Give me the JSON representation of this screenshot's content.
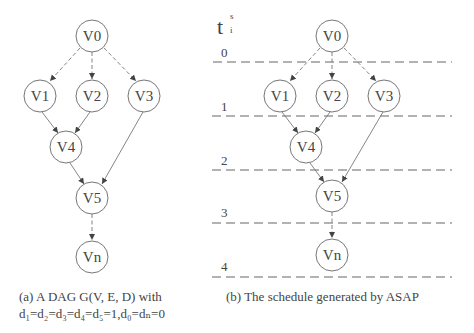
{
  "left_panel": {
    "caption_line1": "(a) A DAG G(V, E, D) with",
    "caption_line2": "d₁=d₂=d₃=d₄=d₅=1,d₀=dₙ=0",
    "nodes": [
      {
        "id": "V0",
        "label": "V0"
      },
      {
        "id": "V1",
        "label": "V1"
      },
      {
        "id": "V2",
        "label": "V2"
      },
      {
        "id": "V3",
        "label": "V3"
      },
      {
        "id": "V4",
        "label": "V4"
      },
      {
        "id": "V5",
        "label": "V5"
      },
      {
        "id": "Vn",
        "label": "Vn"
      }
    ],
    "edges": [
      {
        "from": "V0",
        "to": "V1",
        "style": "dashed"
      },
      {
        "from": "V0",
        "to": "V2",
        "style": "dashed"
      },
      {
        "from": "V0",
        "to": "V3",
        "style": "dashed"
      },
      {
        "from": "V1",
        "to": "V4",
        "style": "solid"
      },
      {
        "from": "V2",
        "to": "V4",
        "style": "solid"
      },
      {
        "from": "V4",
        "to": "V5",
        "style": "solid"
      },
      {
        "from": "V3",
        "to": "V5",
        "style": "solid"
      },
      {
        "from": "V5",
        "to": "Vn",
        "style": "dashed"
      }
    ]
  },
  "right_panel": {
    "axis_label": "t",
    "axis_sup": "s",
    "axis_sub": "i",
    "levels": [
      "0",
      "1",
      "2",
      "3",
      "4"
    ],
    "caption": "(b) The schedule generated by ASAP",
    "nodes": [
      {
        "id": "V0",
        "label": "V0"
      },
      {
        "id": "V1",
        "label": "V1"
      },
      {
        "id": "V2",
        "label": "V2"
      },
      {
        "id": "V3",
        "label": "V3"
      },
      {
        "id": "V4",
        "label": "V4"
      },
      {
        "id": "V5",
        "label": "V5"
      },
      {
        "id": "Vn",
        "label": "Vn"
      }
    ]
  }
}
